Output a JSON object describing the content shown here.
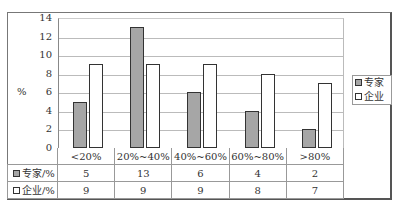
{
  "chart_data": {
    "type": "bar",
    "title": "",
    "xlabel": "",
    "ylabel": "%",
    "ylim": [
      0,
      14
    ],
    "yticks": [
      0,
      2,
      4,
      6,
      8,
      10,
      12,
      14
    ],
    "grid": true,
    "legend_position": "right",
    "categories": [
      "<20%",
      "20%~40%",
      "40%~60%",
      "60%~80%",
      ">80%"
    ],
    "series": [
      {
        "name": "专家",
        "table_label": "专家/%",
        "color": "#a6a6a6",
        "values": [
          5,
          13,
          6,
          4,
          2
        ]
      },
      {
        "name": "企业",
        "table_label": "企业/%",
        "color": "#ffffff",
        "values": [
          9,
          9,
          9,
          8,
          7
        ]
      }
    ],
    "data_table": true
  },
  "axis": {
    "ylabel": "%",
    "ticks": [
      "14",
      "12",
      "10",
      "8",
      "6",
      "4",
      "2",
      "0"
    ]
  },
  "legend": {
    "items": [
      {
        "label": "专家"
      },
      {
        "label": "企业"
      }
    ]
  },
  "table": {
    "categories": [
      "<20%",
      "20%~40%",
      "40%~60%",
      "60%~80%",
      ">80%"
    ],
    "rows": [
      {
        "label": "专家/%",
        "values": [
          "5",
          "13",
          "6",
          "4",
          "2"
        ]
      },
      {
        "label": "企业/%",
        "values": [
          "9",
          "9",
          "9",
          "8",
          "7"
        ]
      }
    ]
  }
}
